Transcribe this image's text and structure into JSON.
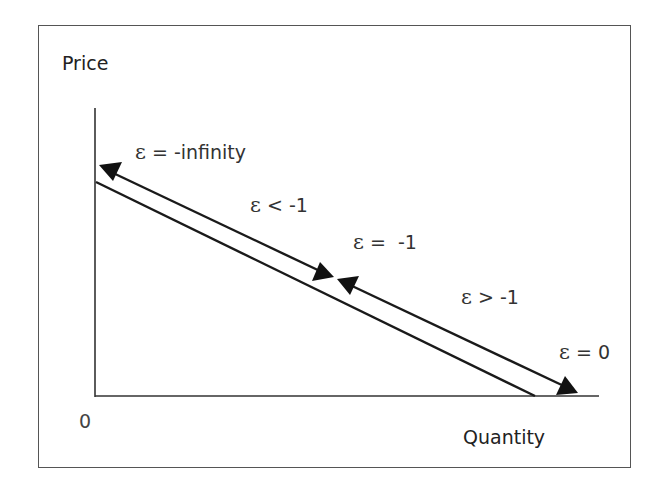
{
  "diagram": {
    "y_axis_label": "Price",
    "x_axis_label": "Quantity",
    "origin_label": "0",
    "symbol": "ε",
    "annotations": [
      {
        "id": "top",
        "relation": "= -infinity"
      },
      {
        "id": "upper",
        "relation": "< -1"
      },
      {
        "id": "mid",
        "relation": "=  -1"
      },
      {
        "id": "lower",
        "relation": "> -1"
      },
      {
        "id": "bottom",
        "relation": "= 0"
      }
    ],
    "colors": {
      "line": "#1a1a1a",
      "frame": "#555555",
      "text": "#333333"
    }
  }
}
